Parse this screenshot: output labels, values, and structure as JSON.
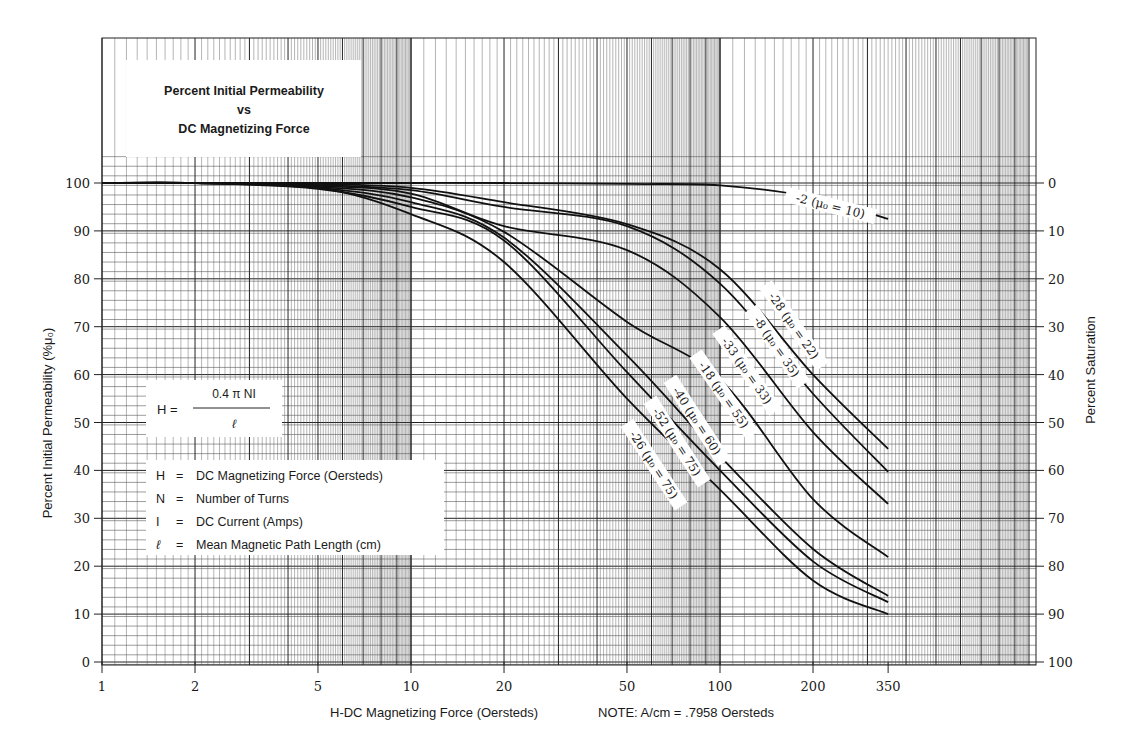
{
  "chart_data": {
    "type": "line",
    "title": "Percent Initial Permeability vs DC Magnetizing Force",
    "title_lines": [
      "Percent Initial Permeability",
      "vs",
      "DC Magnetizing Force"
    ],
    "xlabel": "H-DC Magnetizing Force (Oersteds)",
    "x_note": "NOTE: A/cm = .7958 Oersteds",
    "ylabel": "Percent Initial Permeability (%μ₀)",
    "ylabel_right": "Percent Saturation",
    "x_scale": "log",
    "xlim": [
      1,
      1000
    ],
    "ylim": [
      0,
      100
    ],
    "x_ticks": [
      1,
      2,
      5,
      10,
      20,
      50,
      100,
      200,
      350
    ],
    "x_tick_labels": [
      "1",
      "2",
      "5",
      "10",
      "20",
      "50",
      "100",
      "200",
      "350"
    ],
    "y_ticks": [
      0,
      10,
      20,
      30,
      40,
      50,
      60,
      70,
      80,
      90,
      100
    ],
    "y_tick_labels": [
      "0",
      "10",
      "20",
      "30",
      "40",
      "50",
      "60",
      "70",
      "80",
      "90",
      "100"
    ],
    "y_right_tick_labels": [
      "100",
      "90",
      "80",
      "70",
      "60",
      "50",
      "40",
      "30",
      "20",
      "10",
      "0"
    ],
    "grid": true,
    "x": [
      1,
      2,
      5,
      10,
      20,
      50,
      100,
      200,
      350
    ],
    "series": [
      {
        "name": "-2 (μ₀ = 10)",
        "values": [
          100,
          100,
          100,
          100,
          100,
          99.8,
          99.5,
          97,
          92.5
        ]
      },
      {
        "name": "-28 (μ₀ = 22)",
        "values": [
          100,
          100,
          99.8,
          99,
          96,
          91.4,
          82,
          60,
          44.5
        ]
      },
      {
        "name": "-8 (μ₀ = 35)",
        "values": [
          100,
          100,
          99.6,
          98.5,
          95,
          91,
          79,
          56,
          39.7
        ]
      },
      {
        "name": "-33 (μ₀ = 33)",
        "values": [
          100,
          100,
          99.4,
          97.8,
          91,
          86,
          72,
          48,
          33
        ]
      },
      {
        "name": "-18 (μ₀ = 55)",
        "values": [
          100,
          100,
          99.2,
          97,
          89.8,
          71,
          59,
          34,
          21.9
        ]
      },
      {
        "name": "-40 (μ₀ = 60)",
        "values": [
          100,
          100,
          99,
          96,
          88.6,
          64,
          43,
          23.6,
          13.8
        ]
      },
      {
        "name": "-52 (μ₀ = 75)",
        "values": [
          100,
          100,
          98.8,
          95,
          88,
          60.5,
          40,
          21,
          12.5
        ]
      },
      {
        "name": "-26 (μ₀ = 75)",
        "values": [
          100,
          100,
          99,
          93.5,
          83.5,
          55,
          36,
          17,
          10
        ]
      }
    ],
    "legend": "inline labels along curves"
  },
  "formula": {
    "lhs": "H =",
    "numerator": "0.4 π NI",
    "denominator": "ℓ"
  },
  "definitions": [
    {
      "symbol": "H",
      "eq": "=",
      "text": "DC Magnetizing Force (Oersteds)"
    },
    {
      "symbol": "N",
      "eq": "=",
      "text": "Number of Turns"
    },
    {
      "symbol": "I",
      "eq": "=",
      "text": "DC Current (Amps)"
    },
    {
      "symbol": "ℓ",
      "eq": "=",
      "text": "Mean Magnetic Path Length (cm)"
    }
  ],
  "curve_labels": [
    {
      "id": "-2",
      "text": "-2 (μ₀ = 10)",
      "x": 830,
      "y": 208,
      "rot": 14
    },
    {
      "id": "-28",
      "text": "-28 (μ₀ = 22)",
      "x": 792,
      "y": 327,
      "rot": 55
    },
    {
      "id": "-8",
      "text": "-8 (μ₀ = 35)",
      "x": 775,
      "y": 348,
      "rot": 55
    },
    {
      "id": "-33",
      "text": "-33 (μ₀ = 33)",
      "x": 745,
      "y": 372,
      "rot": 55
    },
    {
      "id": "-18",
      "text": "-18 (μ₀ = 55)",
      "x": 722,
      "y": 396,
      "rot": 55
    },
    {
      "id": "-40",
      "text": "-40 (μ₀ = 60)",
      "x": 695,
      "y": 422,
      "rot": 57
    },
    {
      "id": "-52",
      "text": "-52 (μ₀ = 75)",
      "x": 675,
      "y": 443,
      "rot": 57
    },
    {
      "id": "-26",
      "text": "-26 (μ₀ = 75)",
      "x": 652,
      "y": 466,
      "rot": 57
    }
  ],
  "colors": {
    "background": "#ffffff",
    "grid_minor": "#5a5a5a",
    "grid_major": "#222222",
    "curve": "#111111",
    "text": "#1a1a1a"
  }
}
